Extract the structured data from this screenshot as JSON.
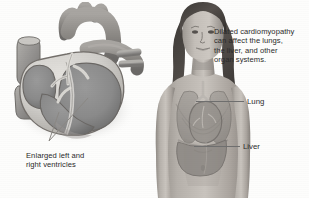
{
  "figure": {
    "background_color": "#fdfdfc",
    "ink_color": "#2b2b2b",
    "leader_color": "#6f6f6f"
  },
  "annotations": {
    "organ_systems_note": "Dilated cardiomyopathy\ncan affect the lungs,\nthe liver, and other\norgan systems.",
    "ventricles_caption": "Enlarged left and\nright ventricles"
  },
  "callouts": [
    {
      "label": "Lung",
      "name": "callout-lung"
    },
    {
      "label": "Liver",
      "name": "callout-liver"
    }
  ],
  "heart_diagram": {
    "name": "cross-sectioned-heart",
    "description": "Coronal cross-section of an enlarged heart showing dilated left and right ventricles",
    "chamber_fill": "#8a8a8a",
    "wall_fill": "#cfcdc9",
    "vessel_fill": "#9b9b9b"
  },
  "body_diagram": {
    "name": "female-torso-with-organs",
    "description": "Grayscale illustration of a young woman's head and torso with translucent lungs, heart and liver overlay",
    "skin_fill": "#b9b4ae",
    "hair_fill": "#4a4643",
    "organ_overlay_fill": "#8e8a86"
  }
}
